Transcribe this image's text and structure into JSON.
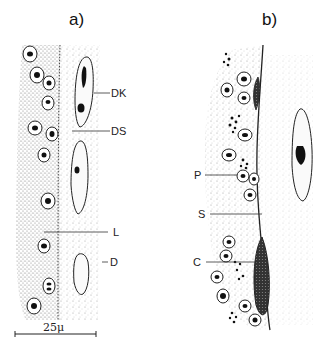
{
  "figure": {
    "panels": [
      {
        "id": "a",
        "label": "a)",
        "annotations": [
          {
            "text": "DK"
          },
          {
            "text": "DS"
          },
          {
            "text": "L"
          },
          {
            "text": "D"
          }
        ]
      },
      {
        "id": "b",
        "label": "b)",
        "annotations": [
          {
            "text": "P"
          },
          {
            "text": "S"
          },
          {
            "text": "C"
          }
        ]
      }
    ],
    "scale_bar": {
      "label": "25μ"
    },
    "colors": {
      "ink": "#111111",
      "background": "#ffffff",
      "stipple": "#8a8a8a"
    }
  }
}
